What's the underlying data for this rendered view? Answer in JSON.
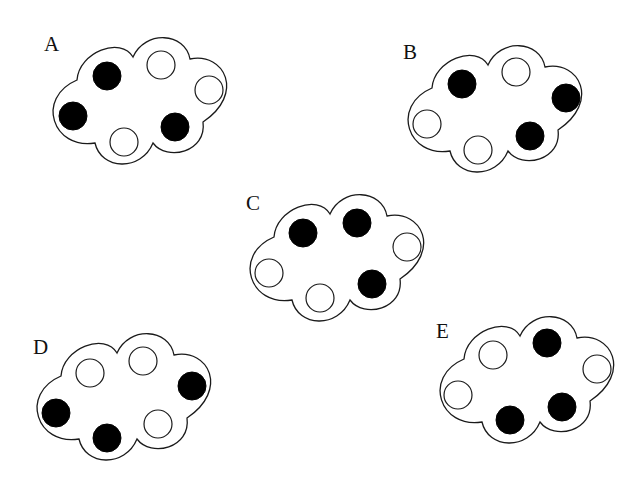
{
  "figure": {
    "colors": {
      "background": "#ffffff",
      "outline": "#1a1a1a",
      "black_dot": "#000000",
      "white_dot": "#ffffff"
    },
    "dot_radius": 14,
    "clouds": [
      {
        "label": "A",
        "origin": [
          49,
          38
        ],
        "label_pos": [
          44,
          51
        ],
        "dots": [
          {
            "color": "black",
            "cx": 107,
            "cy": 76
          },
          {
            "color": "white",
            "cx": 161,
            "cy": 65
          },
          {
            "color": "white",
            "cx": 209,
            "cy": 90
          },
          {
            "color": "black",
            "cx": 73,
            "cy": 116
          },
          {
            "color": "white",
            "cx": 124,
            "cy": 142
          },
          {
            "color": "black",
            "cx": 175,
            "cy": 127
          }
        ]
      },
      {
        "label": "B",
        "origin": [
          404,
          46
        ],
        "label_pos": [
          403,
          59
        ],
        "dots": [
          {
            "color": "black",
            "cx": 462,
            "cy": 84
          },
          {
            "color": "white",
            "cx": 516,
            "cy": 72
          },
          {
            "color": "black",
            "cx": 566,
            "cy": 98
          },
          {
            "color": "white",
            "cx": 427,
            "cy": 124
          },
          {
            "color": "white",
            "cx": 478,
            "cy": 150
          },
          {
            "color": "black",
            "cx": 530,
            "cy": 136
          }
        ]
      },
      {
        "label": "C",
        "origin": [
          246,
          195
        ],
        "label_pos": [
          246,
          210
        ],
        "dots": [
          {
            "color": "black",
            "cx": 303,
            "cy": 233
          },
          {
            "color": "black",
            "cx": 357,
            "cy": 223
          },
          {
            "color": "white",
            "cx": 407,
            "cy": 247
          },
          {
            "color": "white",
            "cx": 269,
            "cy": 273
          },
          {
            "color": "white",
            "cx": 320,
            "cy": 298
          },
          {
            "color": "black",
            "cx": 372,
            "cy": 284
          }
        ]
      },
      {
        "label": "D",
        "origin": [
          33,
          334
        ],
        "label_pos": [
          33,
          354
        ],
        "dots": [
          {
            "color": "white",
            "cx": 90,
            "cy": 373
          },
          {
            "color": "white",
            "cx": 143,
            "cy": 361
          },
          {
            "color": "black",
            "cx": 192,
            "cy": 386
          },
          {
            "color": "black",
            "cx": 56,
            "cy": 413
          },
          {
            "color": "black",
            "cx": 107,
            "cy": 438
          },
          {
            "color": "white",
            "cx": 158,
            "cy": 424
          }
        ]
      },
      {
        "label": "E",
        "origin": [
          436,
          317
        ],
        "label_pos": [
          436,
          338
        ],
        "dots": [
          {
            "color": "white",
            "cx": 493,
            "cy": 355
          },
          {
            "color": "black",
            "cx": 547,
            "cy": 343
          },
          {
            "color": "white",
            "cx": 597,
            "cy": 369
          },
          {
            "color": "white",
            "cx": 458,
            "cy": 395
          },
          {
            "color": "black",
            "cx": 510,
            "cy": 420
          },
          {
            "color": "black",
            "cx": 562,
            "cy": 407
          }
        ]
      }
    ]
  }
}
